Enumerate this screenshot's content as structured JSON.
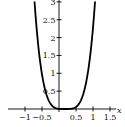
{
  "chart_data": {
    "type": "line",
    "title": "",
    "xlabel": "x",
    "ylabel": "",
    "xlim": [
      -1.25,
      1.75
    ],
    "ylim": [
      0,
      3
    ],
    "grid": false,
    "legend": null,
    "x_ticks": [
      {
        "value": -1,
        "label": "−1"
      },
      {
        "value": -0.5,
        "label": "−0.5"
      },
      {
        "value": 0.5,
        "label": "0.5"
      },
      {
        "value": 1,
        "label": "1"
      },
      {
        "value": 1.5,
        "label": "1.5"
      }
    ],
    "y_ticks": [
      {
        "value": 0.5,
        "label": "0.5"
      },
      {
        "value": 1,
        "label": "1"
      },
      {
        "value": 1.5,
        "label": "1.5"
      },
      {
        "value": 2,
        "label": "2"
      },
      {
        "value": 2.5,
        "label": "2.5"
      },
      {
        "value": 3,
        "label": "3"
      }
    ],
    "series": [
      {
        "name": "curve",
        "color": "#000000",
        "x": [
          -0.72,
          -0.6,
          -0.5,
          -0.4,
          -0.3,
          -0.2,
          -0.1,
          0,
          0.1,
          0.17,
          0.25,
          0.35,
          0.45,
          0.55,
          0.65,
          0.75,
          0.85,
          0.95,
          1.06
        ],
        "y": [
          3.0,
          2.0,
          1.4,
          0.5,
          0.23,
          0.09,
          0.03,
          0.004,
          0.0,
          0.0,
          0.0,
          0.005,
          0.03,
          0.1,
          0.26,
          0.55,
          1.03,
          1.76,
          3.0
        ]
      }
    ]
  }
}
